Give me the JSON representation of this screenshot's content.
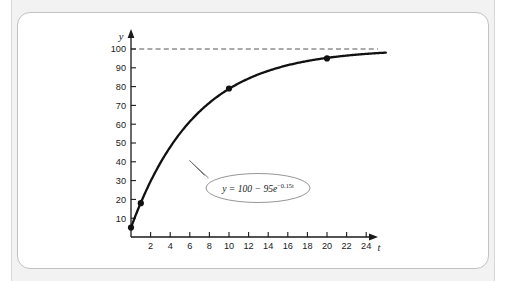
{
  "figure": {
    "equation_label": "y = 100 − 95e",
    "equation_exponent": "−0.15t",
    "equation_plain": "y = 100 - 95e^(-0.15t)"
  },
  "chart_data": {
    "type": "line",
    "title": "",
    "xlabel": "t",
    "ylabel": "y",
    "xlim": [
      0,
      26
    ],
    "ylim": [
      0,
      107
    ],
    "grid": false,
    "legend": "none",
    "x_ticks": [
      2,
      4,
      6,
      8,
      10,
      12,
      14,
      16,
      18,
      20,
      22,
      24
    ],
    "x_tick_labels": [
      "2",
      "4",
      "6",
      "8",
      "10",
      "12",
      "14",
      "16",
      "18",
      "20",
      "22",
      "24"
    ],
    "y_ticks": [
      10,
      20,
      30,
      40,
      50,
      60,
      70,
      80,
      90,
      100
    ],
    "y_tick_labels": [
      "10",
      "20",
      "30",
      "40",
      "50",
      "60",
      "70",
      "80",
      "90",
      "100"
    ],
    "curve": {
      "name": "y = 100 - 95e^(-0.15t)",
      "formula": {
        "asymptote": 100,
        "amplitude": 95,
        "rate": 0.15
      },
      "color": "#111111",
      "x": [
        0,
        1,
        2,
        3,
        4,
        5,
        6,
        7,
        8,
        9,
        10,
        11,
        12,
        13,
        14,
        15,
        16,
        17,
        18,
        19,
        20,
        21,
        22,
        23,
        24,
        25,
        26
      ],
      "y": [
        5.0,
        18.2,
        29.6,
        39.4,
        47.9,
        55.1,
        61.4,
        66.8,
        71.4,
        75.4,
        78.8,
        81.8,
        84.3,
        86.5,
        88.4,
        90.0,
        91.4,
        92.6,
        93.6,
        94.5,
        95.3,
        96.0,
        96.5,
        97.0,
        97.4,
        97.8,
        98.1
      ]
    },
    "points": [
      {
        "x": 0,
        "y": 5
      },
      {
        "x": 1,
        "y": 18
      },
      {
        "x": 10,
        "y": 79
      },
      {
        "x": 20,
        "y": 95
      }
    ],
    "asymptote_line": {
      "y": 100,
      "style": "dashed",
      "color": "#555555"
    },
    "annotations": [
      {
        "text": "y = 100 − 95e^(−0.15t)",
        "shape": "ellipse",
        "anchor_x": 4,
        "anchor_y": 46
      }
    ]
  }
}
